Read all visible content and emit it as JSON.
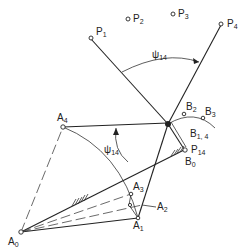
{
  "diagram": {
    "type": "four-bar linkage synthesis diagram",
    "points": {
      "P1": {
        "label": "P",
        "sub": "1"
      },
      "P2": {
        "label": "P",
        "sub": "2"
      },
      "P3": {
        "label": "P",
        "sub": "3"
      },
      "P4": {
        "label": "P",
        "sub": "4"
      },
      "A0": {
        "label": "A",
        "sub": "0"
      },
      "A1": {
        "label": "A",
        "sub": "1"
      },
      "A2": {
        "label": "A",
        "sub": "2"
      },
      "A3": {
        "label": "A",
        "sub": "3"
      },
      "A4": {
        "label": "A",
        "sub": "4"
      },
      "B0": {
        "label": "B",
        "sub": "0"
      },
      "B14": {
        "label": "B",
        "sub": "1, 4"
      },
      "B2": {
        "label": "B",
        "sub": "2"
      },
      "B3": {
        "label": "B",
        "sub": "3"
      },
      "P14": {
        "label": "P",
        "sub": "14"
      }
    },
    "angles": {
      "upper": {
        "label": "ψ",
        "sub": "14"
      },
      "lower": {
        "label": "ψ",
        "sub": "14"
      }
    }
  }
}
